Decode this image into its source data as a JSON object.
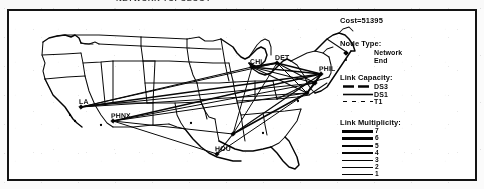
{
  "caption": {
    "text": "NETWORK TOPOLOGY"
  },
  "figure": {
    "cost_label": "Cost=51395"
  },
  "legends": {
    "node_type": {
      "title": "Node Type:",
      "items": [
        {
          "marker": "diamond-marker",
          "label": "Network"
        },
        {
          "marker": "dot-marker",
          "label": "End"
        }
      ]
    },
    "link_capacity": {
      "title": "Link Capacity:",
      "items": [
        {
          "style": "thick-dashed",
          "label": "DS3"
        },
        {
          "style": "medium-solid",
          "label": "DS1"
        },
        {
          "style": "thin-dashed",
          "label": "T1"
        }
      ]
    },
    "link_multiplicity": {
      "title": "Link Multiplicity:",
      "items": [
        {
          "weight": 3.2,
          "label": "7"
        },
        {
          "weight": 2.8,
          "label": "6"
        },
        {
          "weight": 2.4,
          "label": "5"
        },
        {
          "weight": 2.0,
          "label": "4"
        },
        {
          "weight": 1.6,
          "label": "3"
        },
        {
          "weight": 1.2,
          "label": "2"
        },
        {
          "weight": 0.8,
          "label": "1"
        }
      ]
    }
  },
  "map": {
    "cities": [
      {
        "id": "la",
        "label": "LA",
        "x": 72,
        "y": 96,
        "type": "network"
      },
      {
        "id": "phnx",
        "label": "PHNX",
        "x": 104,
        "y": 110,
        "type": "network"
      },
      {
        "id": "hou",
        "label": "HOU",
        "x": 208,
        "y": 143,
        "type": "network"
      },
      {
        "id": "atl",
        "label": "",
        "x": 224,
        "y": 123,
        "type": "network"
      },
      {
        "id": "chi",
        "label": "CHI",
        "x": 243,
        "y": 56,
        "type": "network"
      },
      {
        "id": "det",
        "label": "DET",
        "x": 268,
        "y": 52,
        "type": "network"
      },
      {
        "id": "phil",
        "label": "PHIL",
        "x": 312,
        "y": 63,
        "type": "network"
      },
      {
        "id": "ny",
        "label": "",
        "x": 306,
        "y": 72,
        "type": "network"
      },
      {
        "id": "dc",
        "label": "",
        "x": 298,
        "y": 82,
        "type": "network"
      }
    ],
    "node_dots": [
      {
        "x": 61,
        "y": 104
      },
      {
        "x": 66,
        "y": 110
      },
      {
        "x": 92,
        "y": 114
      },
      {
        "x": 182,
        "y": 112
      },
      {
        "x": 254,
        "y": 122
      },
      {
        "x": 289,
        "y": 90
      }
    ],
    "links": [
      {
        "from": "la",
        "to": "chi",
        "weight": 1.2
      },
      {
        "from": "la",
        "to": "det",
        "weight": 1.0
      },
      {
        "from": "la",
        "to": "phil",
        "weight": 1.6
      },
      {
        "from": "la",
        "to": "ny",
        "weight": 1.0
      },
      {
        "from": "la",
        "to": "dc",
        "weight": 1.0
      },
      {
        "from": "phnx",
        "to": "phil",
        "weight": 1.4
      },
      {
        "from": "phnx",
        "to": "ny",
        "weight": 1.0
      },
      {
        "from": "phnx",
        "to": "dc",
        "weight": 1.0
      },
      {
        "from": "phnx",
        "to": "atl",
        "weight": 1.0
      },
      {
        "from": "phnx",
        "to": "hou",
        "weight": 1.0
      },
      {
        "from": "hou",
        "to": "atl",
        "weight": 1.2
      },
      {
        "from": "hou",
        "to": "dc",
        "weight": 1.0
      },
      {
        "from": "atl",
        "to": "dc",
        "weight": 1.6
      },
      {
        "from": "atl",
        "to": "phil",
        "weight": 1.2
      },
      {
        "from": "atl",
        "to": "chi",
        "weight": 1.0
      },
      {
        "from": "atl",
        "to": "det",
        "weight": 1.0
      },
      {
        "from": "chi",
        "to": "det",
        "weight": 2.0
      },
      {
        "from": "chi",
        "to": "phil",
        "weight": 1.6
      },
      {
        "from": "chi",
        "to": "ny",
        "weight": 1.2
      },
      {
        "from": "chi",
        "to": "dc",
        "weight": 1.2
      },
      {
        "from": "det",
        "to": "phil",
        "weight": 1.8
      },
      {
        "from": "det",
        "to": "ny",
        "weight": 1.2
      },
      {
        "from": "det",
        "to": "dc",
        "weight": 1.0
      },
      {
        "from": "ny",
        "to": "dc",
        "weight": 1.8
      },
      {
        "from": "ny",
        "to": "phil",
        "weight": 2.0
      },
      {
        "from": "phil",
        "to": "dc",
        "weight": 1.6
      }
    ]
  }
}
